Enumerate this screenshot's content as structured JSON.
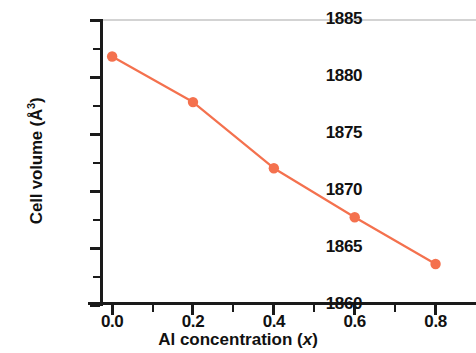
{
  "chart_data": {
    "type": "line",
    "title": "",
    "xlabel": "Al concentration (x)",
    "xlabel_parts": {
      "text": "Al concentration (",
      "italic": "x",
      "tail": ")"
    },
    "ylabel": "Cell volume (Å3)",
    "ylabel_parts": {
      "text": "Cell volume (Å",
      "superscript": "3",
      "tail": ")"
    },
    "x": [
      0.0,
      0.2,
      0.4,
      0.6,
      0.8
    ],
    "values": [
      1881.8,
      1877.8,
      1872.0,
      1867.7,
      1863.6
    ],
    "series": [
      {
        "name": "Cell volume",
        "color": "#F4714E",
        "marker": "circle",
        "values": [
          1881.8,
          1877.8,
          1872.0,
          1867.7,
          1863.6
        ]
      }
    ],
    "xlim": [
      -0.03,
      0.9
    ],
    "ylim": [
      1860,
      1885
    ],
    "xticks": [
      0.0,
      0.2,
      0.4,
      0.6,
      0.8
    ],
    "xtick_labels": [
      "0.0",
      "0.2",
      "0.4",
      "0.6",
      "0.8"
    ],
    "xticks_minor": [
      0.1,
      0.3,
      0.5,
      0.7
    ],
    "yticks": [
      1860,
      1865,
      1870,
      1875,
      1880,
      1885
    ],
    "ytick_labels": [
      "1860",
      "1865",
      "1870",
      "1875",
      "1880",
      "1885"
    ],
    "yticks_minor": [
      1862.5,
      1867.5,
      1872.5,
      1877.5,
      1882.5
    ],
    "grid": false,
    "legend": false,
    "legend_position": "none",
    "line_color": "#F4714E",
    "marker_color": "#F4714E",
    "axis_color": "#1a1a1a",
    "top_frame_color": "#d3d3d3",
    "background": "#ffffff"
  }
}
